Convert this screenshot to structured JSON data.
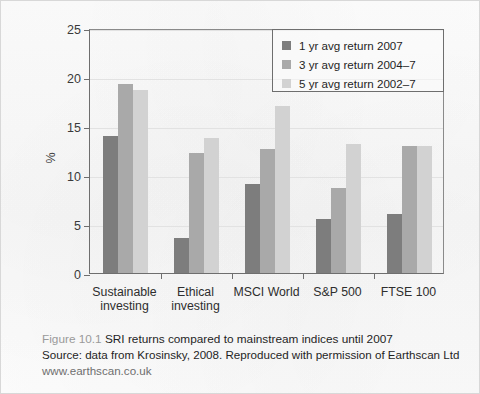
{
  "figure": {
    "caption_number": "Figure 10.1",
    "caption_title": "SRI returns compared to mainstream indices until 2007",
    "source_line": "Source: data from Krosinsky, 2008. Reproduced with permission of Earthscan Ltd",
    "url_line": "www.earthscan.co.uk"
  },
  "chart_data": {
    "type": "bar",
    "title": "",
    "xlabel": "",
    "ylabel": "%",
    "ylim": [
      0,
      25
    ],
    "yticks": [
      0,
      5,
      10,
      15,
      20,
      25
    ],
    "ytick_labels": [
      "0",
      "5",
      "10",
      "15",
      "20",
      "25"
    ],
    "grid": true,
    "legend_position": "top-right",
    "categories": [
      "Sustainable\ninvesting",
      "Ethical\ninvesting",
      "MSCI World",
      "S&P 500",
      "FTSE 100"
    ],
    "series": [
      {
        "name": "1 yr avg return 2007",
        "color": "#7d7d7d",
        "values": [
          14.0,
          3.6,
          9.1,
          5.5,
          6.0
        ]
      },
      {
        "name": "3 yr avg return 2004–7",
        "color": "#a9a9a9",
        "values": [
          19.3,
          12.2,
          12.7,
          8.7,
          13.0
        ]
      },
      {
        "name": "5 yr avg return 2002–7",
        "color": "#d2d2d2",
        "values": [
          18.7,
          13.8,
          17.0,
          13.2,
          13.0
        ]
      }
    ]
  },
  "legend": {
    "items": [
      {
        "label": "1 yr avg return 2007",
        "color": "#7d7d7d"
      },
      {
        "label": "3 yr avg return 2004–7",
        "color": "#a9a9a9"
      },
      {
        "label": "5 yr avg return 2002–7",
        "color": "#d2d2d2"
      }
    ]
  }
}
